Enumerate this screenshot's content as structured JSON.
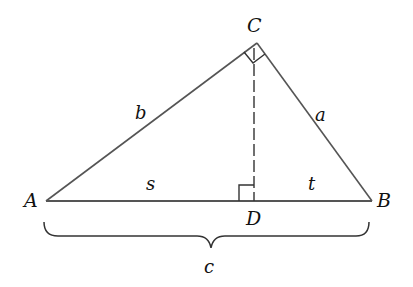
{
  "diagram": {
    "type": "right-triangle-with-altitude",
    "colors": {
      "line": "#555555",
      "text": "#111111",
      "background": "#ffffff"
    },
    "vertices": {
      "A": {
        "label": "A",
        "x": 46,
        "y": 201
      },
      "B": {
        "label": "B",
        "x": 372,
        "y": 201
      },
      "C": {
        "label": "C",
        "x": 257,
        "y": 43
      },
      "D": {
        "label": "D",
        "x": 254,
        "y": 201
      }
    },
    "sides": {
      "a": {
        "label": "a",
        "from": "C",
        "to": "B"
      },
      "b": {
        "label": "b",
        "from": "A",
        "to": "C"
      },
      "s": {
        "label": "s",
        "from": "A",
        "to": "D"
      },
      "t": {
        "label": "t",
        "from": "D",
        "to": "B"
      },
      "c": {
        "label": "c",
        "from": "A",
        "to": "B",
        "style": "brace"
      }
    },
    "altitude": {
      "from": "C",
      "to": "D",
      "style": "dashed"
    },
    "right_angles": [
      "C",
      "D"
    ]
  }
}
